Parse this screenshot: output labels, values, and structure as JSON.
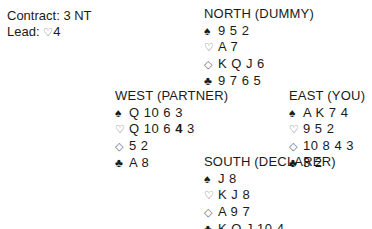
{
  "contract": {
    "label": "Contract:",
    "value": "3 NT"
  },
  "lead": {
    "label": "Lead:",
    "suit_symbol": "♡",
    "card": "4"
  },
  "suits": {
    "spades": "♠",
    "hearts": "♡",
    "diamonds": "◇",
    "clubs": "♣"
  },
  "hands": {
    "north": {
      "title": "NORTH (DUMMY)",
      "spades": "9 5 2",
      "hearts": "A 7",
      "diamonds": "K Q J 6",
      "clubs": "9 7 6 5"
    },
    "west": {
      "title": "WEST (PARTNER)",
      "spades": "Q 10 6 3",
      "hearts_pre": "Q 10 6 ",
      "hearts_highlight": "4",
      "hearts_post": " 3",
      "diamonds": "5 2",
      "clubs": "A 8"
    },
    "east": {
      "title": "EAST (YOU)",
      "spades": "A K 7 4",
      "hearts": "9 5 2",
      "diamonds": "10 8 4 3",
      "clubs": "3 2"
    },
    "south": {
      "title": "SOUTH (DECLARER)",
      "spades": "J 8",
      "hearts": "K J 8",
      "diamonds": "A 9 7",
      "clubs": "K Q J 10 4"
    }
  }
}
